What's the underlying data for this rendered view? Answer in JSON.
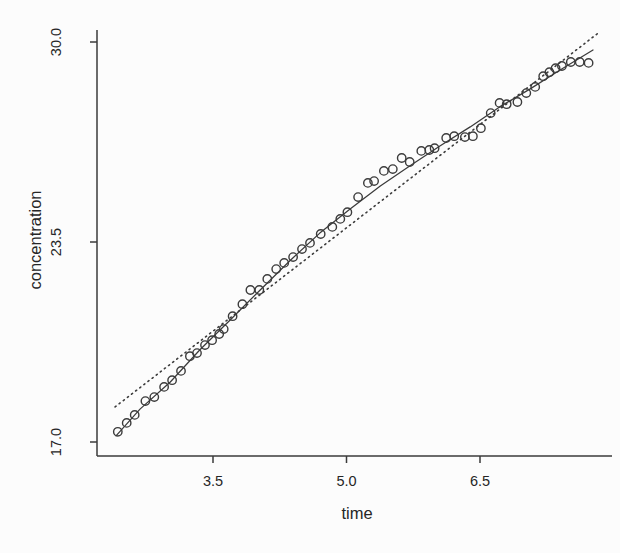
{
  "figure": {
    "background_color": "#fcfcfc",
    "ink_color": "#3b3b3b",
    "text_color": "#262626"
  },
  "chart_data": {
    "type": "scatter",
    "title": "",
    "xlabel": "time",
    "ylabel": "concentration",
    "x_tick_labels": [
      "3.5",
      "5.0",
      "6.5"
    ],
    "x_tick_values": [
      3.5,
      5.0,
      6.5
    ],
    "y_tick_labels": [
      "17.0",
      "23.5",
      "30.0"
    ],
    "y_tick_values": [
      17.0,
      23.5,
      30.0
    ],
    "xlim": [
      2.2,
      7.9
    ],
    "ylim": [
      16.4,
      30.6
    ],
    "grid": false,
    "legend": "none",
    "marker": "open-circle",
    "points": [
      [
        2.43,
        17.33
      ],
      [
        2.53,
        17.62
      ],
      [
        2.62,
        17.88
      ],
      [
        2.74,
        18.33
      ],
      [
        2.84,
        18.46
      ],
      [
        2.95,
        18.79
      ],
      [
        3.04,
        19.01
      ],
      [
        3.14,
        19.31
      ],
      [
        3.24,
        19.79
      ],
      [
        3.32,
        19.89
      ],
      [
        3.41,
        20.15
      ],
      [
        3.49,
        20.31
      ],
      [
        3.57,
        20.51
      ],
      [
        3.62,
        20.67
      ],
      [
        3.72,
        21.09
      ],
      [
        3.83,
        21.48
      ],
      [
        3.92,
        21.94
      ],
      [
        4.02,
        21.94
      ],
      [
        4.11,
        22.3
      ],
      [
        4.21,
        22.62
      ],
      [
        4.3,
        22.82
      ],
      [
        4.4,
        23.01
      ],
      [
        4.5,
        23.27
      ],
      [
        4.59,
        23.47
      ],
      [
        4.71,
        23.76
      ],
      [
        4.84,
        23.99
      ],
      [
        4.93,
        24.25
      ],
      [
        5.01,
        24.47
      ],
      [
        5.13,
        24.96
      ],
      [
        5.24,
        25.42
      ],
      [
        5.31,
        25.48
      ],
      [
        5.42,
        25.81
      ],
      [
        5.52,
        25.87
      ],
      [
        5.62,
        26.23
      ],
      [
        5.71,
        26.1
      ],
      [
        5.84,
        26.46
      ],
      [
        5.93,
        26.49
      ],
      [
        5.99,
        26.55
      ],
      [
        6.12,
        26.88
      ],
      [
        6.21,
        26.94
      ],
      [
        6.33,
        26.91
      ],
      [
        6.42,
        26.94
      ],
      [
        6.51,
        27.2
      ],
      [
        6.62,
        27.69
      ],
      [
        6.72,
        28.02
      ],
      [
        6.8,
        27.98
      ],
      [
        6.92,
        28.05
      ],
      [
        7.02,
        28.34
      ],
      [
        7.12,
        28.54
      ],
      [
        7.21,
        28.89
      ],
      [
        7.28,
        29.02
      ],
      [
        7.35,
        29.15
      ],
      [
        7.42,
        29.22
      ],
      [
        7.52,
        29.35
      ],
      [
        7.62,
        29.35
      ],
      [
        7.72,
        29.32
      ]
    ],
    "fits": [
      {
        "name": "smooth-fit",
        "style": "solid",
        "points": [
          [
            2.41,
            17.2
          ],
          [
            2.68,
            18.07
          ],
          [
            3.02,
            18.95
          ],
          [
            3.35,
            19.99
          ],
          [
            3.69,
            20.96
          ],
          [
            4.03,
            21.94
          ],
          [
            4.37,
            22.91
          ],
          [
            4.7,
            23.79
          ],
          [
            5.04,
            24.57
          ],
          [
            5.38,
            25.32
          ],
          [
            5.71,
            25.97
          ],
          [
            6.05,
            26.62
          ],
          [
            6.39,
            27.24
          ],
          [
            6.72,
            27.89
          ],
          [
            7.06,
            28.47
          ],
          [
            7.4,
            29.09
          ],
          [
            7.77,
            29.74
          ]
        ]
      },
      {
        "name": "linear-fit",
        "style": "dotted",
        "points": [
          [
            2.4,
            18.14
          ],
          [
            7.84,
            30.32
          ]
        ]
      }
    ]
  }
}
